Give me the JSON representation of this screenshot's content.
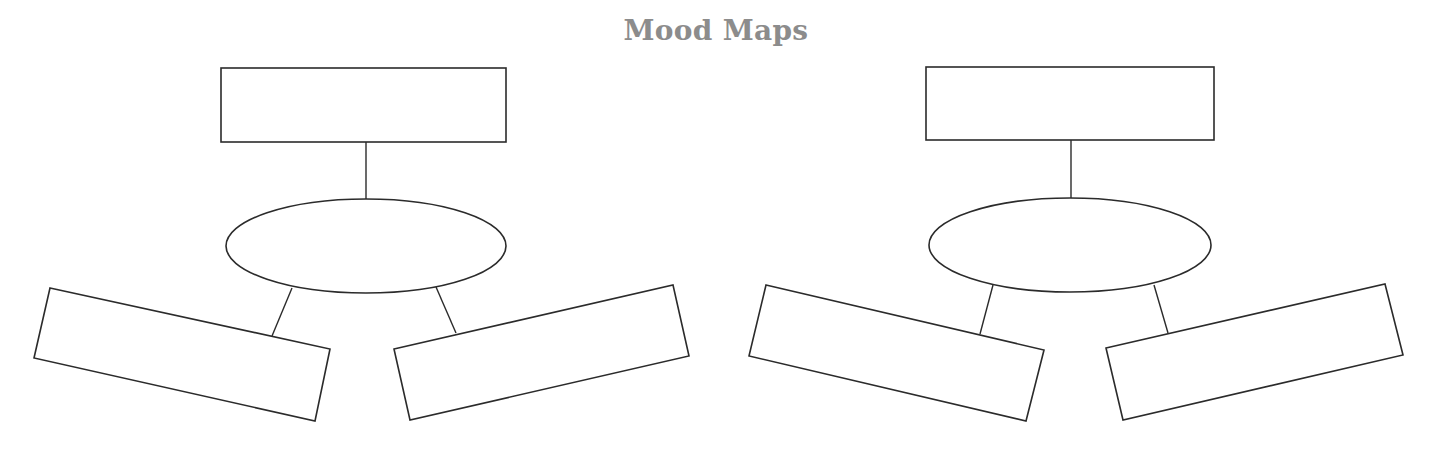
{
  "title": "Mood Maps",
  "colors": {
    "title": "#8c8c8c",
    "stroke": "#2b2b2b",
    "background": "#ffffff"
  },
  "maps": [
    {
      "id": "mood-map-1",
      "top_box": {
        "label": ""
      },
      "center_ellipse": {
        "label": ""
      },
      "left_box": {
        "label": ""
      },
      "right_box": {
        "label": ""
      }
    },
    {
      "id": "mood-map-2",
      "top_box": {
        "label": ""
      },
      "center_ellipse": {
        "label": ""
      },
      "left_box": {
        "label": ""
      },
      "right_box": {
        "label": ""
      }
    }
  ]
}
